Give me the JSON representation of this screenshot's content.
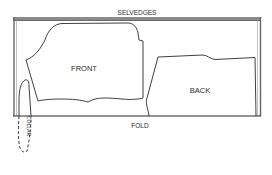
{
  "diagram": {
    "type": "sewing-pattern-layout",
    "labels": {
      "selvedges": "SELVEDGES",
      "fold": "FOLD",
      "front": "FRONT",
      "back": "BACK",
      "collar": "COLLAR"
    },
    "pieces": [
      {
        "name": "front",
        "label": "FRONT",
        "style": "solid"
      },
      {
        "name": "back",
        "label": "BACK",
        "style": "solid"
      },
      {
        "name": "collar",
        "label": "COLLAR",
        "style": "dashed",
        "note": "extends beyond fold"
      }
    ],
    "colors": {
      "line": "#2a2a2a",
      "selvedge_band": "#8a8a8a",
      "background": "#ffffff"
    }
  }
}
